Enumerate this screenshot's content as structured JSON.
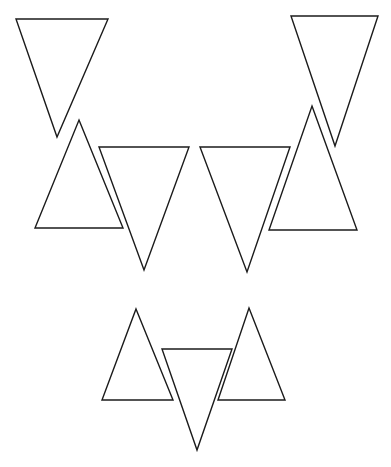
{
  "figure": {
    "canvas": {
      "width": 391,
      "height": 467,
      "background_color": "#ffffff"
    },
    "style": {
      "stroke_color": "#1b1b1b",
      "stroke_width": 1.4,
      "fill": "none"
    },
    "shape_count": 9,
    "clusters": [
      {
        "name": "upper-left-cluster",
        "shape_ids": [
          "triangle-1",
          "triangle-2",
          "triangle-3"
        ]
      },
      {
        "name": "upper-right-cluster",
        "shape_ids": [
          "triangle-4",
          "triangle-5",
          "triangle-6"
        ]
      },
      {
        "name": "lower-center-cluster",
        "shape_ids": [
          "triangle-7",
          "triangle-8",
          "triangle-9"
        ]
      }
    ],
    "shapes": [
      {
        "id": "triangle-1",
        "label": "upper-left inverted triangle",
        "orientation": "pointing-down",
        "points": "16,19 108,19 57,137",
        "vertices": [
          [
            16,
            19
          ],
          [
            108,
            19
          ],
          [
            57,
            137
          ]
        ]
      },
      {
        "id": "triangle-2",
        "label": "upper-left upright triangle",
        "orientation": "pointing-up",
        "points": "79,120 123,228 35,228",
        "vertices": [
          [
            79,
            120
          ],
          [
            123,
            228
          ],
          [
            35,
            228
          ]
        ]
      },
      {
        "id": "triangle-3",
        "label": "left-center inverted triangle",
        "orientation": "pointing-down",
        "points": "99,147 189,147 144,270",
        "vertices": [
          [
            99,
            147
          ],
          [
            189,
            147
          ],
          [
            144,
            270
          ]
        ]
      },
      {
        "id": "triangle-4",
        "label": "right-center inverted triangle",
        "orientation": "pointing-down",
        "points": "200,147 290,147 247,272",
        "vertices": [
          [
            200,
            147
          ],
          [
            290,
            147
          ],
          [
            247,
            272
          ]
        ]
      },
      {
        "id": "triangle-5",
        "label": "upper-right inverted triangle",
        "orientation": "pointing-down",
        "points": "291,16 378,16 335,146",
        "vertices": [
          [
            291,
            16
          ],
          [
            378,
            16
          ],
          [
            335,
            146
          ]
        ]
      },
      {
        "id": "triangle-6",
        "label": "upper-right upright triangle",
        "orientation": "pointing-up",
        "points": "312,106 357,230 269,230",
        "vertices": [
          [
            312,
            106
          ],
          [
            357,
            230
          ],
          [
            269,
            230
          ]
        ]
      },
      {
        "id": "triangle-7",
        "label": "lower-left upright triangle",
        "orientation": "pointing-up",
        "points": "136,309 173,400 102,400",
        "vertices": [
          [
            136,
            309
          ],
          [
            173,
            400
          ],
          [
            102,
            400
          ]
        ]
      },
      {
        "id": "triangle-8",
        "label": "lower-center inverted triangle",
        "orientation": "pointing-down",
        "points": "162,349 232,349 197,450",
        "vertices": [
          [
            162,
            349
          ],
          [
            232,
            349
          ],
          [
            197,
            450
          ]
        ]
      },
      {
        "id": "triangle-9",
        "label": "lower-right upright triangle",
        "orientation": "pointing-up",
        "points": "249,308 285,400 218,400",
        "vertices": [
          [
            249,
            308
          ],
          [
            285,
            400
          ],
          [
            218,
            400
          ]
        ]
      }
    ]
  }
}
